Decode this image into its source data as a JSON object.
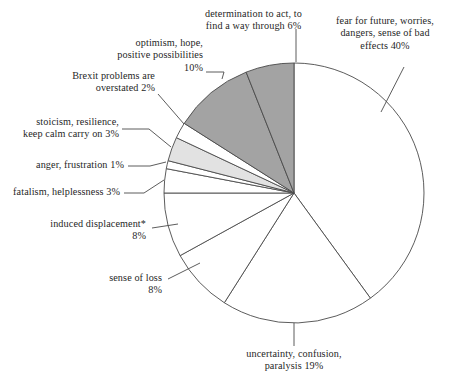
{
  "chart_data": {
    "type": "pie",
    "title": "",
    "subtitle": "",
    "xlabel": "",
    "ylabel": "",
    "legend_position": "none",
    "grid": false,
    "units": "percent",
    "total": 100,
    "start_angle_deg": 0,
    "direction": "clockwise",
    "center": {
      "x": 294,
      "y": 193
    },
    "radius": 130,
    "categories": [
      "fear for future, worries, dangers, sense of bad effects",
      "uncertainty, confusion, paralysis",
      "sense of loss",
      "induced displacement*",
      "fatalism, helplessness",
      "anger, frustration",
      "stoicism, resilience, keep calm carry on",
      "Brexit problems are overstated",
      "optimism, hope, positive possibilities",
      "determination to act, to find a way through"
    ],
    "values": [
      40,
      19,
      8,
      8,
      3,
      1,
      3,
      2,
      10,
      6
    ],
    "colors": [
      "#ffffff",
      "#ffffff",
      "#ffffff",
      "#ffffff",
      "#ffffff",
      "#ffffff",
      "#e2e2e2",
      "#ffffff",
      "#a3a3a3",
      "#a3a3a3"
    ],
    "stroke": "#4a4a4a",
    "slices": [
      {
        "label": "fear for future, worries, dangers, sense of bad effects",
        "value": 40,
        "value_text": "40%",
        "color": "#ffffff"
      },
      {
        "label": "uncertainty, confusion, paralysis",
        "value": 19,
        "value_text": "19%",
        "color": "#ffffff"
      },
      {
        "label": "sense of loss",
        "value": 8,
        "value_text": "8%",
        "color": "#ffffff"
      },
      {
        "label": "induced displacement*",
        "value": 8,
        "value_text": "8%",
        "color": "#ffffff"
      },
      {
        "label": "fatalism, helplessness",
        "value": 3,
        "value_text": "3%",
        "color": "#ffffff"
      },
      {
        "label": "anger, frustration",
        "value": 1,
        "value_text": "1%",
        "color": "#ffffff"
      },
      {
        "label": "stoicism, resilience, keep calm carry on",
        "value": 3,
        "value_text": "3%",
        "color": "#e2e2e2"
      },
      {
        "label": "Brexit problems are overstated",
        "value": 2,
        "value_text": "2%",
        "color": "#ffffff"
      },
      {
        "label": "optimism, hope, positive possibilities",
        "value": 10,
        "value_text": "10%",
        "color": "#a3a3a3"
      },
      {
        "label": "determination to act, to find a way through",
        "value": 6,
        "value_text": "6%",
        "color": "#a3a3a3"
      }
    ]
  },
  "labels": {
    "determination": "determination to act, to\nfind a way through 6%",
    "fear": "fear for future, worries,\ndangers, sense of bad\neffects 40%",
    "optimism": "optimism, hope,\npositive possibilities\n10%",
    "brexit": "Brexit problems are\noverstated 2%",
    "stoicism": "stoicism, resilience,\nkeep calm carry on 3%",
    "anger": "anger, frustration 1%",
    "fatalism": "fatalism, helplessness 3%",
    "displacement": "induced displacement*\n8%",
    "loss": "sense of loss\n8%",
    "uncertainty": "uncertainty, confusion,\nparalysis 19%"
  }
}
